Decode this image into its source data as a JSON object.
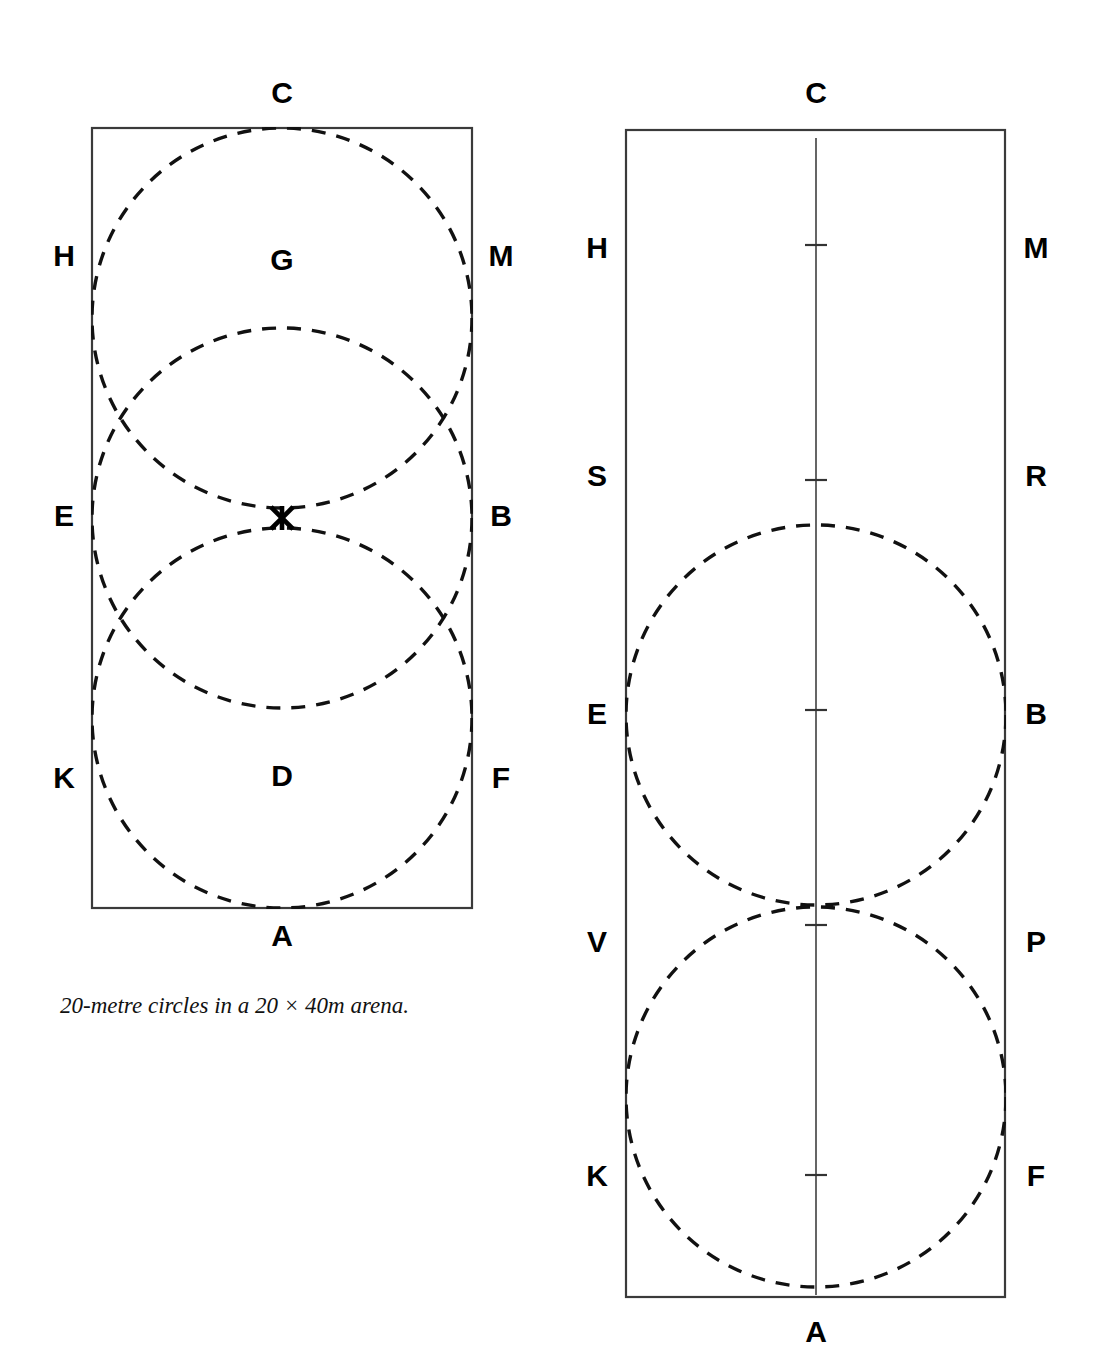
{
  "figure": {
    "caption": "20-metre circles in a 20 × 40m arena.",
    "stroke_color": "#111111",
    "arena_stroke_color": "#3a3a3a",
    "centre_line_color": "#555555"
  },
  "left_diagram": {
    "name": "three-overlapping-20m-circles",
    "arena": {
      "x": 92,
      "y": 128,
      "width": 380,
      "height": 780,
      "label": "20 x 40m arena"
    },
    "markers": [
      {
        "letter": "C",
        "x": 282,
        "y": 95,
        "side": "top"
      },
      {
        "letter": "H",
        "x": 64,
        "y": 258,
        "side": "left"
      },
      {
        "letter": "M",
        "x": 501,
        "y": 258,
        "side": "right"
      },
      {
        "letter": "G",
        "x": 282,
        "y": 262,
        "side": "inside"
      },
      {
        "letter": "E",
        "x": 64,
        "y": 518,
        "side": "left"
      },
      {
        "letter": "B",
        "x": 501,
        "y": 518,
        "side": "right"
      },
      {
        "letter": "K",
        "x": 64,
        "y": 780,
        "side": "left"
      },
      {
        "letter": "F",
        "x": 501,
        "y": 780,
        "side": "right"
      },
      {
        "letter": "D",
        "x": 282,
        "y": 778,
        "side": "inside"
      },
      {
        "letter": "A",
        "x": 282,
        "y": 938,
        "side": "bottom"
      }
    ],
    "centre_marker": {
      "name": "X",
      "x": 282,
      "y": 518
    },
    "circles": [
      {
        "label": "circle-at-G",
        "cx": 282,
        "cy": 318,
        "r": 190
      },
      {
        "label": "circle-at-X",
        "cx": 282,
        "cy": 518,
        "r": 190
      },
      {
        "label": "circle-at-D",
        "cx": 282,
        "cy": 718,
        "r": 190
      }
    ]
  },
  "right_diagram": {
    "name": "two-tangent-20m-circles",
    "arena": {
      "x": 626,
      "y": 130,
      "width": 379,
      "height": 1167,
      "label": "20 x 40m arena"
    },
    "markers": [
      {
        "letter": "C",
        "x": 816,
        "y": 95,
        "side": "top"
      },
      {
        "letter": "H",
        "x": 597,
        "y": 250,
        "side": "left"
      },
      {
        "letter": "M",
        "x": 1036,
        "y": 250,
        "side": "right"
      },
      {
        "letter": "S",
        "x": 597,
        "y": 478,
        "side": "left"
      },
      {
        "letter": "R",
        "x": 1036,
        "y": 478,
        "side": "right"
      },
      {
        "letter": "E",
        "x": 597,
        "y": 716,
        "side": "left"
      },
      {
        "letter": "B",
        "x": 1036,
        "y": 716,
        "side": "right"
      },
      {
        "letter": "V",
        "x": 597,
        "y": 944,
        "side": "left"
      },
      {
        "letter": "P",
        "x": 1036,
        "y": 944,
        "side": "right"
      },
      {
        "letter": "K",
        "x": 597,
        "y": 1178,
        "side": "left"
      },
      {
        "letter": "F",
        "x": 1036,
        "y": 1178,
        "side": "right"
      },
      {
        "letter": "A",
        "x": 816,
        "y": 1334,
        "side": "bottom"
      }
    ],
    "centre_line": {
      "x": 816,
      "y1": 138,
      "y2": 1295
    },
    "centre_ticks": [
      {
        "label": "tick-at-H-M",
        "y": 245
      },
      {
        "label": "tick-at-S-R",
        "y": 480
      },
      {
        "label": "tick-at-X",
        "y": 710
      },
      {
        "label": "tick-at-V-P",
        "y": 925
      },
      {
        "label": "tick-at-K-F",
        "y": 1175
      }
    ],
    "circles": [
      {
        "label": "upper-circle",
        "cx": 816,
        "cy": 715,
        "r": 190
      },
      {
        "label": "lower-circle",
        "cx": 816,
        "cy": 1097,
        "r": 190
      }
    ]
  }
}
